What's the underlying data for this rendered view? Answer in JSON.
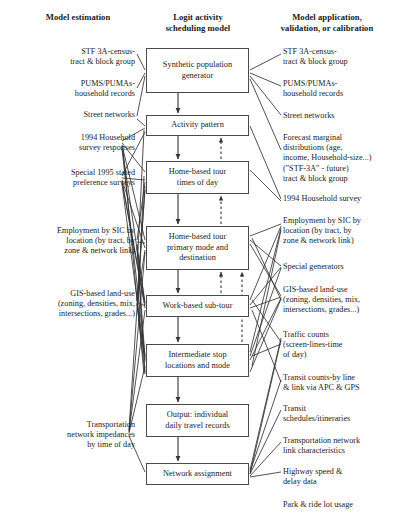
{
  "figure": {
    "type": "flowchart",
    "background_color": "#ffffff",
    "line_color": "#333333",
    "box_border_color": "#4a4a4a"
  },
  "columns": {
    "left_header": "Model estimation",
    "middle_header": "Logit activity\nscheduling model",
    "right_header": "Model application,\nvalidation, or calibration"
  },
  "middle_nodes": [
    {
      "id": "synthetic",
      "label": "Synthetic population\ngenerator",
      "x": 146,
      "y": 48,
      "w": 103,
      "h": 45
    },
    {
      "id": "activity",
      "label": "Activity pattern",
      "x": 146,
      "y": 115,
      "w": 103,
      "h": 21
    },
    {
      "id": "hbtimes",
      "label": "Home-based tour\ntimes of day",
      "x": 146,
      "y": 161,
      "w": 103,
      "h": 33
    },
    {
      "id": "hbmode",
      "label": "Home-based tour\nprimary mode and\ndestination",
      "x": 146,
      "y": 226,
      "w": 103,
      "h": 44
    },
    {
      "id": "worksub",
      "label": "Work-based sub-tour",
      "x": 146,
      "y": 295,
      "w": 103,
      "h": 22
    },
    {
      "id": "interstop",
      "label": "Intermediate stop\nlocations and mode",
      "x": 146,
      "y": 344,
      "w": 103,
      "h": 33
    },
    {
      "id": "output",
      "label": "Output: individual\ndaily travel records",
      "x": 146,
      "y": 404,
      "w": 103,
      "h": 33
    },
    {
      "id": "network",
      "label": "Network assignment",
      "x": 146,
      "y": 463,
      "w": 103,
      "h": 22
    }
  ],
  "left_labels": [
    {
      "id": "stf3a",
      "text": "STF 3A-census-\ntract & block group",
      "x": 18,
      "y": 47,
      "w": 117
    },
    {
      "id": "pums",
      "text": "PUMS/PUMAs-\nhousehold records",
      "x": 18,
      "y": 79,
      "w": 117
    },
    {
      "id": "streets",
      "text": "Street networks",
      "x": 18,
      "y": 110,
      "w": 117
    },
    {
      "id": "hhsurvey94",
      "text": "1994 Household\nsurvey responses",
      "x": 18,
      "y": 133,
      "w": 117
    },
    {
      "id": "statedpref95",
      "text": "Special 1995 stated\npreference surveys",
      "x": 18,
      "y": 168,
      "w": 117
    },
    {
      "id": "employment",
      "text": "Employment by SIC by\nlocation (by tract, by\nzone & network link)",
      "x": 5,
      "y": 226,
      "w": 130
    },
    {
      "id": "gislanduse",
      "text": "GIS-based land-use\n(zoning, densities, mix,\nintersections, grades...)",
      "x": 5,
      "y": 289,
      "w": 130
    },
    {
      "id": "impedances",
      "text": "Transportation\nnetwork impedances\nby time of day",
      "x": 12,
      "y": 420,
      "w": 123
    }
  ],
  "right_labels": [
    {
      "id": "r-stf3a",
      "text": "STF 3A-census-\ntract & block group",
      "x": 283,
      "y": 47,
      "w": 112
    },
    {
      "id": "r-pums",
      "text": "PUMS/PUMAs-\nhousehold records",
      "x": 283,
      "y": 79,
      "w": 112
    },
    {
      "id": "r-streets",
      "text": "Street networks",
      "x": 283,
      "y": 111,
      "w": 112
    },
    {
      "id": "r-forecast",
      "text": "Forecast marginal\ndistributions (age,\nincome, Household-size...)\n(\"STF-3A\" - future)\ntract & block group",
      "x": 283,
      "y": 133,
      "w": 112
    },
    {
      "id": "r-hhsurvey",
      "text": "1994 Household survey",
      "x": 283,
      "y": 194,
      "w": 112
    },
    {
      "id": "r-employment",
      "text": "Employment by SIC by\nlocation (by tract, by\nzone & network link)",
      "x": 283,
      "y": 216,
      "w": 112
    },
    {
      "id": "r-specialgen",
      "text": "Special generators",
      "x": 283,
      "y": 262,
      "w": 112
    },
    {
      "id": "r-gislanduse",
      "text": "GIS-based land-use\n(zoning, densities, mix,\nintersections, grades...)",
      "x": 283,
      "y": 285,
      "w": 112
    },
    {
      "id": "r-traffic",
      "text": "Traffic counts\n(screen-lines-time\nof day)",
      "x": 283,
      "y": 330,
      "w": 112
    },
    {
      "id": "r-transitcnt",
      "text": "Transit counts-by line\n& link via APC & GPS",
      "x": 283,
      "y": 373,
      "w": 112
    },
    {
      "id": "r-transitsch",
      "text": "Transit\nschedules/itineraries",
      "x": 283,
      "y": 404,
      "w": 112
    },
    {
      "id": "r-translink",
      "text": "Transportation network\nlink characteristics",
      "x": 283,
      "y": 436,
      "w": 112
    },
    {
      "id": "r-highway",
      "text": "Highway speed &\ndelay data",
      "x": 283,
      "y": 467,
      "w": 112
    },
    {
      "id": "r-parkride",
      "text": "Park & ride lot usage",
      "x": 283,
      "y": 500,
      "w": 112
    }
  ],
  "flow_arrows_solid": [
    {
      "from": "synthetic",
      "to": "activity"
    },
    {
      "from": "activity",
      "to": "hbtimes"
    },
    {
      "from": "hbtimes",
      "to": "hbmode"
    },
    {
      "from": "hbmode",
      "to": "worksub"
    },
    {
      "from": "worksub",
      "to": "interstop"
    },
    {
      "from": "interstop",
      "to": "output"
    },
    {
      "from": "output",
      "to": "network"
    }
  ],
  "feedback_arrows_dashed": [
    {
      "from": "hbtimes",
      "to": "activity"
    },
    {
      "from": "hbmode",
      "to": "hbtimes"
    },
    {
      "from": "worksub",
      "to": "hbmode"
    },
    {
      "from": "interstop",
      "to": "hbmode"
    }
  ]
}
